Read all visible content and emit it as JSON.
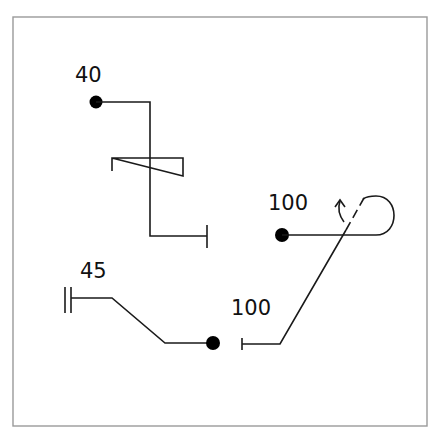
{
  "diagram": {
    "frame": {
      "x": 13,
      "y": 17,
      "width": 414,
      "height": 409,
      "stroke": "#9a9a9a"
    },
    "colors": {
      "line": "#1a1a1a",
      "dot": "#000000",
      "background": "#ffffff"
    },
    "routes": [
      {
        "id": "route-40",
        "label": "40",
        "label_pos": [
          75,
          82
        ],
        "start_marker": "dot",
        "start": [
          96,
          102
        ],
        "end_marker": "tick",
        "points": [
          [
            96,
            102
          ],
          [
            150,
            102
          ],
          [
            150,
            236
          ],
          [
            207,
            236
          ]
        ],
        "end_tick": [
          [
            207,
            225
          ],
          [
            207,
            248
          ]
        ],
        "zigzag": [
          [
            112,
            171
          ],
          [
            112,
            158
          ],
          [
            183,
            158
          ],
          [
            183,
            176
          ],
          [
            112,
            158
          ]
        ]
      },
      {
        "id": "route-100-upper",
        "label": "100",
        "label_pos": [
          268,
          210
        ],
        "start_marker": "dot",
        "start": [
          282,
          235
        ],
        "loop": "M282,235 L376,235 C400,235 400,196 376,196 C368,196 364,198 362,200",
        "turn_arrow": {
          "stem": "M344,222 C338,214 338,207 340,200",
          "head": [
            [
              335,
              206
            ],
            [
              340,
              200
            ],
            [
              345,
              206
            ]
          ]
        }
      },
      {
        "id": "route-45",
        "label": "45",
        "label_pos": [
          80,
          278
        ],
        "start_marker": "double-bar",
        "double_bar": [
          [
            [
              65,
              287
            ],
            [
              65,
              313
            ]
          ],
          [
            [
              71,
              287
            ],
            [
              71,
              313
            ]
          ]
        ],
        "points": [
          [
            71,
            298
          ],
          [
            112,
            298
          ],
          [
            165,
            343
          ],
          [
            213,
            343
          ]
        ],
        "end_marker": "dot",
        "end": [
          213,
          343
        ]
      },
      {
        "id": "route-100-lower",
        "label": "100",
        "label_pos": [
          231,
          315
        ],
        "start_marker": "tick",
        "start_tick": [
          [
            242,
            338
          ],
          [
            242,
            350
          ]
        ],
        "points": [
          [
            242,
            344
          ],
          [
            280,
            344
          ],
          [
            346,
            230
          ]
        ],
        "dashed_continuation": [
          [
            346,
            230
          ],
          [
            364,
            198
          ]
        ]
      }
    ]
  }
}
